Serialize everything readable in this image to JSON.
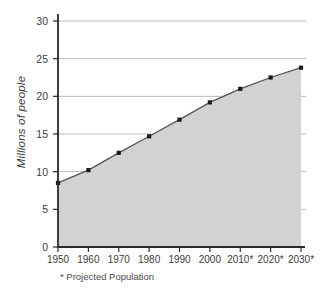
{
  "chart_data": {
    "type": "area",
    "title": "",
    "subtitle": "",
    "xlabel": "",
    "ylabel": "Millions of people",
    "categories": [
      "1950",
      "1960",
      "1970",
      "1980",
      "1990",
      "2000",
      "2010*",
      "2020*",
      "2030*"
    ],
    "values": [
      8.5,
      10.2,
      12.5,
      14.7,
      16.9,
      19.2,
      21.0,
      22.5,
      23.8
    ],
    "series": [
      {
        "name": "Population",
        "values": [
          8.5,
          10.2,
          12.5,
          14.7,
          16.9,
          19.2,
          21.0,
          22.5,
          23.8
        ]
      }
    ],
    "ylim": [
      0,
      30
    ],
    "yticks": [
      "0",
      "5",
      "10",
      "15",
      "20",
      "25",
      "30"
    ],
    "ytick_values": [
      0,
      5,
      10,
      15,
      20,
      25,
      30
    ],
    "grid": true,
    "legend": "none",
    "annotations": [
      "* Projected Population"
    ],
    "colors": {
      "area_fill": "#d2d2d2",
      "line": "#555555",
      "marker": "#1a1a1a",
      "gridline": "#b4b4b4",
      "axis": "#2b2b2b",
      "text": "#3c3c3c",
      "background": "#ffffff"
    }
  },
  "figure": {
    "y_axis_title": "Millions of people",
    "footnote": "* Projected Population"
  }
}
